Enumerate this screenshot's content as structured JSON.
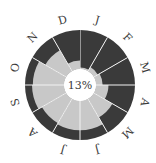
{
  "chart_data": {
    "type": "radial-bar",
    "title": "",
    "center_label": "13%",
    "categories": [
      "J",
      "F",
      "M",
      "A",
      "M",
      "J",
      "J",
      "A",
      "S",
      "O",
      "N",
      "D"
    ],
    "series": [
      {
        "name": "light",
        "values": [
          4,
          12,
          17,
          32,
          55,
          75,
          75,
          72,
          82,
          80,
          62,
          22
        ]
      },
      {
        "name": "dark",
        "values": [
          96,
          88,
          83,
          68,
          45,
          25,
          25,
          28,
          18,
          20,
          38,
          78
        ]
      }
    ],
    "ylim": [
      0,
      100
    ],
    "colors": {
      "dark": "#3a3a3a",
      "light": "#c8c8c8",
      "separator": "#f2f2f2",
      "text": "#3a3a3a",
      "background": "#ffffff"
    },
    "geometry": {
      "cx": 80,
      "cy": 85,
      "inner_r": 16,
      "outer_r": 55,
      "label_r": 67
    }
  }
}
